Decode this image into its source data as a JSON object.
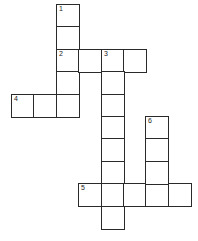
{
  "puzzle": {
    "type": "crossword",
    "cell_size_px": 22.4,
    "origin_px": [
      12,
      5
    ],
    "clues": [
      {
        "number": "1",
        "direction": "down",
        "col": 2,
        "row": 0,
        "length": 5
      },
      {
        "number": "2",
        "direction": "across",
        "col": 2,
        "row": 2,
        "length": 4
      },
      {
        "number": "3",
        "direction": "down",
        "col": 4,
        "row": 2,
        "length": 8
      },
      {
        "number": "4",
        "direction": "across",
        "col": 0,
        "row": 4,
        "length": 3
      },
      {
        "number": "5",
        "direction": "across",
        "col": 3,
        "row": 8,
        "length": 5
      },
      {
        "number": "6",
        "direction": "down",
        "col": 6,
        "row": 5,
        "length": 4
      }
    ]
  }
}
